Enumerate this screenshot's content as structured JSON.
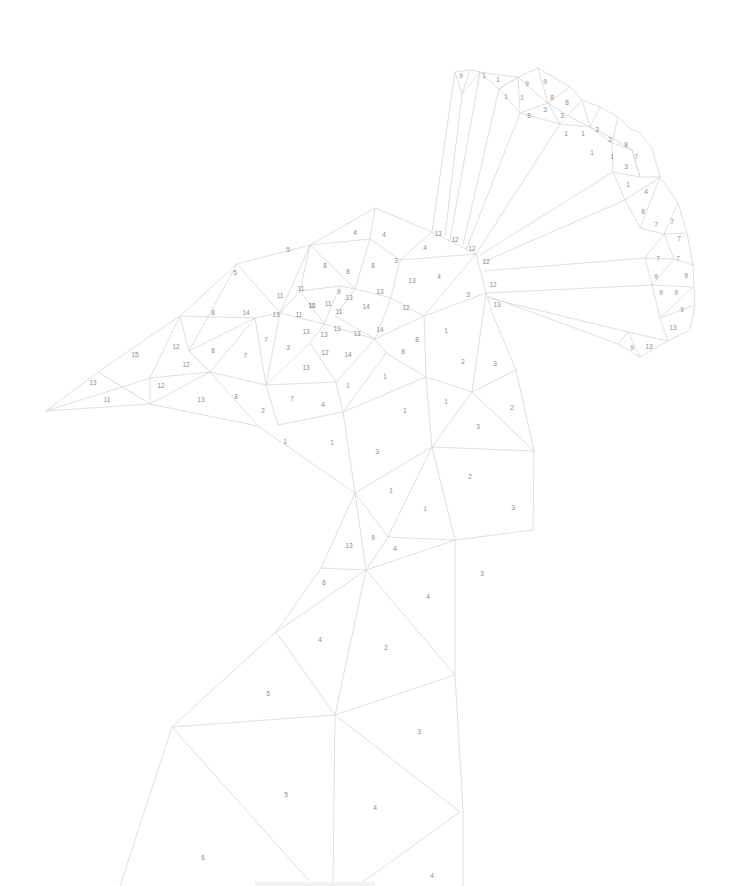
{
  "artwork": {
    "type": "paint-by-number line drawing",
    "subject": "low-poly bird head with fan crest",
    "line_color": "#d6d6d6",
    "number_color": "#8a8a8a",
    "background": "#ffffff"
  },
  "labels": [
    {
      "n": "9",
      "x": 461,
      "y": 76
    },
    {
      "n": "1",
      "x": 484,
      "y": 76
    },
    {
      "n": "1",
      "x": 498,
      "y": 80
    },
    {
      "n": "9",
      "x": 527,
      "y": 84
    },
    {
      "n": "9",
      "x": 545,
      "y": 82
    },
    {
      "n": "1",
      "x": 506,
      "y": 97
    },
    {
      "n": "1",
      "x": 522,
      "y": 98
    },
    {
      "n": "8",
      "x": 552,
      "y": 98
    },
    {
      "n": "8",
      "x": 567,
      "y": 103
    },
    {
      "n": "8",
      "x": 529,
      "y": 116
    },
    {
      "n": "3",
      "x": 545,
      "y": 110
    },
    {
      "n": "3",
      "x": 562,
      "y": 116
    },
    {
      "n": "1",
      "x": 566,
      "y": 134
    },
    {
      "n": "1",
      "x": 583,
      "y": 134
    },
    {
      "n": "3",
      "x": 597,
      "y": 130
    },
    {
      "n": "2",
      "x": 610,
      "y": 140
    },
    {
      "n": "8",
      "x": 626,
      "y": 145
    },
    {
      "n": "1",
      "x": 592,
      "y": 153
    },
    {
      "n": "1",
      "x": 612,
      "y": 157
    },
    {
      "n": "7",
      "x": 636,
      "y": 157
    },
    {
      "n": "3",
      "x": 626,
      "y": 167
    },
    {
      "n": "1",
      "x": 628,
      "y": 185
    },
    {
      "n": "4",
      "x": 646,
      "y": 192
    },
    {
      "n": "8",
      "x": 643,
      "y": 212
    },
    {
      "n": "7",
      "x": 656,
      "y": 225
    },
    {
      "n": "7",
      "x": 672,
      "y": 222
    },
    {
      "n": "7",
      "x": 679,
      "y": 239
    },
    {
      "n": "7",
      "x": 658,
      "y": 259
    },
    {
      "n": "7",
      "x": 678,
      "y": 259
    },
    {
      "n": "9",
      "x": 656,
      "y": 277
    },
    {
      "n": "9",
      "x": 686,
      "y": 276
    },
    {
      "n": "9",
      "x": 661,
      "y": 293
    },
    {
      "n": "9",
      "x": 676,
      "y": 293
    },
    {
      "n": "9",
      "x": 682,
      "y": 310
    },
    {
      "n": "13",
      "x": 673,
      "y": 328
    },
    {
      "n": "9",
      "x": 632,
      "y": 348
    },
    {
      "n": "13",
      "x": 649,
      "y": 347
    },
    {
      "n": "13",
      "x": 438,
      "y": 234
    },
    {
      "n": "12",
      "x": 455,
      "y": 240
    },
    {
      "n": "12",
      "x": 472,
      "y": 249
    },
    {
      "n": "12",
      "x": 486,
      "y": 262
    },
    {
      "n": "12",
      "x": 493,
      "y": 285
    },
    {
      "n": "13",
      "x": 497,
      "y": 305
    },
    {
      "n": "5",
      "x": 288,
      "y": 250
    },
    {
      "n": "4",
      "x": 355,
      "y": 233
    },
    {
      "n": "4",
      "x": 384,
      "y": 235
    },
    {
      "n": "4",
      "x": 425,
      "y": 248
    },
    {
      "n": "5",
      "x": 235,
      "y": 273
    },
    {
      "n": "8",
      "x": 325,
      "y": 266
    },
    {
      "n": "8",
      "x": 348,
      "y": 272
    },
    {
      "n": "8",
      "x": 373,
      "y": 266
    },
    {
      "n": "3",
      "x": 396,
      "y": 261
    },
    {
      "n": "13",
      "x": 412,
      "y": 281
    },
    {
      "n": "4",
      "x": 439,
      "y": 277
    },
    {
      "n": "3",
      "x": 468,
      "y": 295
    },
    {
      "n": "11",
      "x": 301,
      "y": 289
    },
    {
      "n": "11",
      "x": 280,
      "y": 296
    },
    {
      "n": "9",
      "x": 339,
      "y": 292
    },
    {
      "n": "13",
      "x": 349,
      "y": 298
    },
    {
      "n": "13",
      "x": 380,
      "y": 292
    },
    {
      "n": "8",
      "x": 213,
      "y": 313
    },
    {
      "n": "14",
      "x": 246,
      "y": 313
    },
    {
      "n": "11",
      "x": 312,
      "y": 306
    },
    {
      "n": "10",
      "x": 312,
      "y": 306
    },
    {
      "n": "11",
      "x": 328,
      "y": 304
    },
    {
      "n": "11",
      "x": 339,
      "y": 312
    },
    {
      "n": "14",
      "x": 366,
      "y": 307
    },
    {
      "n": "12",
      "x": 406,
      "y": 308
    },
    {
      "n": "13",
      "x": 276,
      "y": 315
    },
    {
      "n": "11",
      "x": 299,
      "y": 315
    },
    {
      "n": "1",
      "x": 446,
      "y": 331
    },
    {
      "n": "13",
      "x": 306,
      "y": 332
    },
    {
      "n": "13",
      "x": 324,
      "y": 335
    },
    {
      "n": "13",
      "x": 337,
      "y": 329
    },
    {
      "n": "13",
      "x": 357,
      "y": 334
    },
    {
      "n": "14",
      "x": 380,
      "y": 330
    },
    {
      "n": "12",
      "x": 176,
      "y": 347
    },
    {
      "n": "15",
      "x": 135,
      "y": 355
    },
    {
      "n": "8",
      "x": 213,
      "y": 351
    },
    {
      "n": "7",
      "x": 266,
      "y": 340
    },
    {
      "n": "3",
      "x": 288,
      "y": 348
    },
    {
      "n": "12",
      "x": 325,
      "y": 353
    },
    {
      "n": "14",
      "x": 348,
      "y": 355
    },
    {
      "n": "8",
      "x": 417,
      "y": 340
    },
    {
      "n": "8",
      "x": 403,
      "y": 352
    },
    {
      "n": "2",
      "x": 463,
      "y": 362
    },
    {
      "n": "3",
      "x": 495,
      "y": 364
    },
    {
      "n": "7",
      "x": 245,
      "y": 356
    },
    {
      "n": "12",
      "x": 186,
      "y": 365
    },
    {
      "n": "13",
      "x": 306,
      "y": 368
    },
    {
      "n": "1",
      "x": 385,
      "y": 377
    },
    {
      "n": "13",
      "x": 93,
      "y": 383
    },
    {
      "n": "12",
      "x": 161,
      "y": 386
    },
    {
      "n": "1",
      "x": 348,
      "y": 386
    },
    {
      "n": "11",
      "x": 107,
      "y": 400
    },
    {
      "n": "13",
      "x": 201,
      "y": 400
    },
    {
      "n": "8",
      "x": 236,
      "y": 397
    },
    {
      "n": "7",
      "x": 292,
      "y": 399
    },
    {
      "n": "2",
      "x": 263,
      "y": 411
    },
    {
      "n": "4",
      "x": 323,
      "y": 405
    },
    {
      "n": "1",
      "x": 405,
      "y": 411
    },
    {
      "n": "1",
      "x": 446,
      "y": 402
    },
    {
      "n": "2",
      "x": 512,
      "y": 408
    },
    {
      "n": "3",
      "x": 478,
      "y": 427
    },
    {
      "n": "1",
      "x": 285,
      "y": 442
    },
    {
      "n": "1",
      "x": 332,
      "y": 443
    },
    {
      "n": "3",
      "x": 377,
      "y": 452
    },
    {
      "n": "2",
      "x": 470,
      "y": 477
    },
    {
      "n": "1",
      "x": 391,
      "y": 491
    },
    {
      "n": "1",
      "x": 425,
      "y": 509
    },
    {
      "n": "3",
      "x": 513,
      "y": 508
    },
    {
      "n": "13",
      "x": 349,
      "y": 546
    },
    {
      "n": "9",
      "x": 373,
      "y": 538
    },
    {
      "n": "4",
      "x": 395,
      "y": 549
    },
    {
      "n": "3",
      "x": 482,
      "y": 574
    },
    {
      "n": "6",
      "x": 324,
      "y": 583
    },
    {
      "n": "4",
      "x": 428,
      "y": 597
    },
    {
      "n": "4",
      "x": 320,
      "y": 640
    },
    {
      "n": "2",
      "x": 386,
      "y": 648
    },
    {
      "n": "5",
      "x": 268,
      "y": 694
    },
    {
      "n": "3",
      "x": 419,
      "y": 732
    },
    {
      "n": "5",
      "x": 286,
      "y": 795
    },
    {
      "n": "4",
      "x": 375,
      "y": 808
    },
    {
      "n": "6",
      "x": 203,
      "y": 858
    },
    {
      "n": "4",
      "x": 432,
      "y": 876
    }
  ]
}
